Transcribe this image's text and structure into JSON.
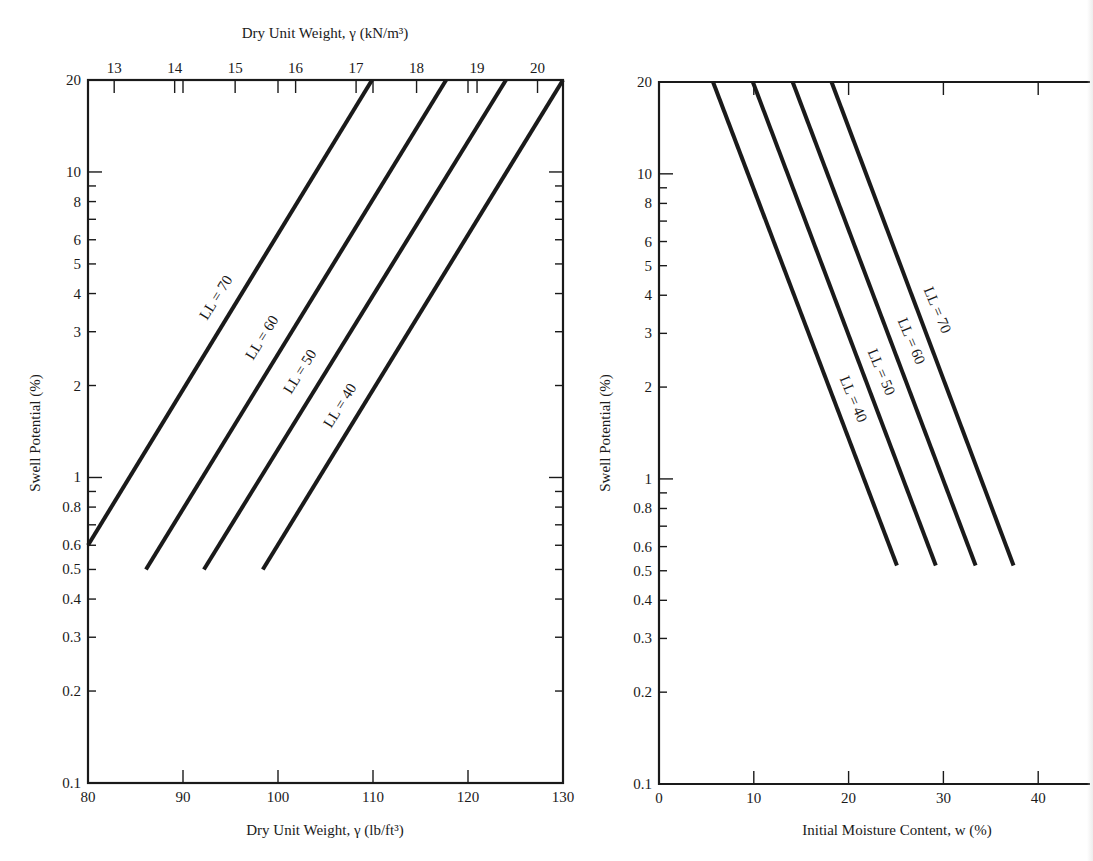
{
  "chart_data": [
    {
      "type": "line",
      "title": "",
      "xlabel": "Dry Unit Weight, γ (lb/ft³)",
      "xlabel_top": "Dry Unit Weight, γ (kN/m³)",
      "ylabel": "Swell Potential (%)",
      "xlim": [
        80,
        130
      ],
      "ylim": [
        0.1,
        20
      ],
      "yscale": "log",
      "grid": false,
      "x_ticks": [
        80,
        90,
        100,
        110,
        120,
        130
      ],
      "x_top_ticks": [
        13,
        14,
        15,
        16,
        17,
        18,
        19,
        20
      ],
      "y_ticks_labeled": [
        0.1,
        0.2,
        0.3,
        0.4,
        0.5,
        0.6,
        0.8,
        1,
        2,
        3,
        4,
        5,
        6,
        8,
        10,
        20
      ],
      "y_ticks_minor": [
        0.7,
        0.9,
        7,
        9
      ],
      "series": [
        {
          "name": "LL = 70",
          "x": [
            80,
            109.9
          ],
          "y": [
            0.6,
            20
          ]
        },
        {
          "name": "LL = 60",
          "x": [
            86.1,
            117.7
          ],
          "y": [
            0.5,
            20
          ]
        },
        {
          "name": "LL = 50",
          "x": [
            92.2,
            124.0
          ],
          "y": [
            0.5,
            20
          ]
        },
        {
          "name": "LL = 40",
          "x": [
            98.4,
            130.0
          ],
          "y": [
            0.5,
            20
          ]
        }
      ]
    },
    {
      "type": "line",
      "title": "",
      "xlabel": "Initial Moisture Content, w (%)",
      "ylabel": "Swell Potential (%)",
      "xlim": [
        0,
        45
      ],
      "ylim": [
        0.1,
        20
      ],
      "yscale": "log",
      "grid": false,
      "x_ticks": [
        0,
        10,
        20,
        30,
        40
      ],
      "y_ticks_labeled": [
        0.1,
        0.2,
        0.3,
        0.4,
        0.5,
        0.6,
        0.8,
        1,
        2,
        3,
        4,
        5,
        6,
        8,
        10,
        20
      ],
      "y_ticks_minor": [
        0.7,
        0.9,
        7,
        9
      ],
      "series": [
        {
          "name": "LL = 40",
          "x": [
            5.7,
            25.1
          ],
          "y": [
            20,
            0.52
          ]
        },
        {
          "name": "LL = 50",
          "x": [
            9.9,
            29.2
          ],
          "y": [
            20,
            0.52
          ]
        },
        {
          "name": "LL = 60",
          "x": [
            14.1,
            33.4
          ],
          "y": [
            20,
            0.52
          ]
        },
        {
          "name": "LL = 70",
          "x": [
            18.2,
            37.4
          ],
          "y": [
            20,
            0.52
          ]
        }
      ]
    }
  ],
  "left_chart": {
    "top_axis_title": "Dry Unit Weight, γ (kN/m³)",
    "bottom_axis_title": "Dry Unit Weight, γ (lb/ft³)",
    "y_axis_title": "Swell Potential (%)",
    "labels": {
      "ll70": "LL = 70",
      "ll60": "LL = 60",
      "ll50": "LL = 50",
      "ll40": "LL = 40"
    }
  },
  "right_chart": {
    "bottom_axis_title": "Initial Moisture Content, w (%)",
    "y_axis_title": "Swell Potential (%)",
    "labels": {
      "ll70": "LL = 70",
      "ll60": "LL = 60",
      "ll50": "LL = 50",
      "ll40": "LL = 40"
    }
  },
  "colors": {
    "ink": "#1a1a1a",
    "background": "#ffffff"
  }
}
